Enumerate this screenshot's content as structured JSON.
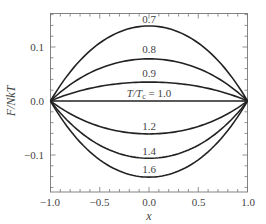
{
  "chart_data": {
    "type": "line",
    "title": "",
    "xlabel": "x",
    "ylabel": "F/NkT",
    "xlim": [
      -1.0,
      1.0
    ],
    "ylim": [
      -0.168,
      0.163
    ],
    "grid": false,
    "legend": "inline curve labels",
    "x_ticks": [
      -1.0,
      -0.5,
      0.0,
      0.5,
      1.0
    ],
    "x_tick_labels": [
      "−1.0",
      "−0.5",
      "0.0",
      "0.5",
      "1.0"
    ],
    "y_ticks": [
      -0.1,
      0.0,
      0.1
    ],
    "y_tick_labels": [
      "−0.1",
      "0.0",
      "0.1"
    ],
    "x": [
      -1.0,
      -0.75,
      -0.5,
      -0.25,
      0.0,
      0.25,
      0.5,
      0.75,
      1.0
    ],
    "series": [
      {
        "name": "0.7",
        "label": "0.7",
        "values": [
          0.0,
          0.061,
          0.104,
          0.13,
          0.139,
          0.13,
          0.104,
          0.061,
          0.0
        ]
      },
      {
        "name": "0.8",
        "label": "0.8",
        "values": [
          0.0,
          0.034,
          0.059,
          0.073,
          0.078,
          0.073,
          0.059,
          0.034,
          0.0
        ]
      },
      {
        "name": "0.9",
        "label": "0.9",
        "values": [
          0.0,
          0.015,
          0.026,
          0.033,
          0.035,
          0.033,
          0.026,
          0.015,
          0.0
        ]
      },
      {
        "name": "1.0",
        "label": "T/T_c = 1.0",
        "values": [
          0.0,
          0.0,
          0.0,
          0.0,
          0.0,
          0.0,
          0.0,
          0.0,
          0.0
        ]
      },
      {
        "name": "1.2",
        "label": "1.2",
        "values": [
          0.0,
          -0.027,
          -0.046,
          -0.057,
          -0.061,
          -0.057,
          -0.046,
          -0.027,
          0.0
        ]
      },
      {
        "name": "1.4",
        "label": "1.4",
        "values": [
          0.0,
          -0.046,
          -0.08,
          -0.099,
          -0.106,
          -0.099,
          -0.08,
          -0.046,
          0.0
        ]
      },
      {
        "name": "1.6",
        "label": "1.6",
        "values": [
          0.0,
          -0.062,
          -0.106,
          -0.132,
          -0.141,
          -0.132,
          -0.106,
          -0.062,
          0.0
        ]
      }
    ],
    "curve_label_text": {
      "c07": "0.7",
      "c08": "0.8",
      "c09": "0.9",
      "c10_prefix": "T/T",
      "c10_sub": "c",
      "c10_suffix": " = 1.0",
      "c12": "1.2",
      "c14": "1.4",
      "c16": "1.6"
    },
    "colors": {
      "line": "#222222",
      "axis": "#666666",
      "text": "#444444"
    }
  }
}
